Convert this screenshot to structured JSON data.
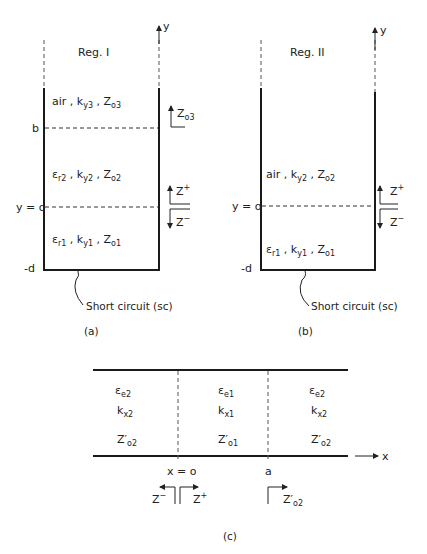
{
  "figure_a": {
    "region_label": "Reg. I",
    "axis_label": "y",
    "layer3": {
      "medium": "air",
      "k": "k",
      "k_sub": "y3",
      "z": "Z",
      "z_sub": "o3"
    },
    "layer2": {
      "eps": "ε",
      "eps_sub": "r2",
      "k": "k",
      "k_sub": "y2",
      "z": "Z",
      "z_sub": "o2"
    },
    "layer1": {
      "eps": "ε",
      "eps_sub": "r1",
      "k": "k",
      "k_sub": "y1",
      "z": "Z",
      "z_sub": "o1"
    },
    "mark_b": "b",
    "mark_y0": "y = o",
    "mark_d": "-d",
    "z_up_top": {
      "z": "Z",
      "sub": "o3"
    },
    "z_plus": {
      "z": "Z",
      "sup": "+"
    },
    "z_minus": {
      "z": "Z",
      "sup": "−"
    },
    "short_label": "Short circuit (sc)",
    "caption": "(a)"
  },
  "figure_b": {
    "region_label": "Reg. II",
    "axis_label": "y",
    "layer2": {
      "medium": "air",
      "k": "k",
      "k_sub": "y2",
      "z": "Z",
      "z_sub": "o2"
    },
    "layer1": {
      "eps": "ε",
      "eps_sub": "r1",
      "k": "k",
      "k_sub": "y1",
      "z": "Z",
      "z_sub": "o1"
    },
    "mark_y0": "y = o",
    "mark_d": "-d",
    "z_plus": {
      "z": "Z",
      "sup": "+"
    },
    "z_minus": {
      "z": "Z",
      "sup": "−"
    },
    "short_label": "Short circuit (sc)",
    "caption": "(b)"
  },
  "figure_c": {
    "axis_label": "x",
    "left": {
      "eps": "ε",
      "eps_sub": "e2",
      "k": "k",
      "k_sub": "x2",
      "z": "Z′",
      "z_sub": "o2"
    },
    "center": {
      "eps": "ε",
      "eps_sub": "e1",
      "k": "k",
      "k_sub": "x1",
      "z": "Z′",
      "z_sub": "o1"
    },
    "right": {
      "eps": "ε",
      "eps_sub": "e2",
      "k": "k",
      "k_sub": "x2",
      "z": "Z′",
      "z_sub": "o2"
    },
    "mark_x0": "x = o",
    "mark_a": "a",
    "z_minus": {
      "z": "Z",
      "sup": "−"
    },
    "z_plus": {
      "z": "Z",
      "sup": "+"
    },
    "z_right": {
      "z": "Z′",
      "sub": "o2"
    },
    "caption": "(c)"
  }
}
